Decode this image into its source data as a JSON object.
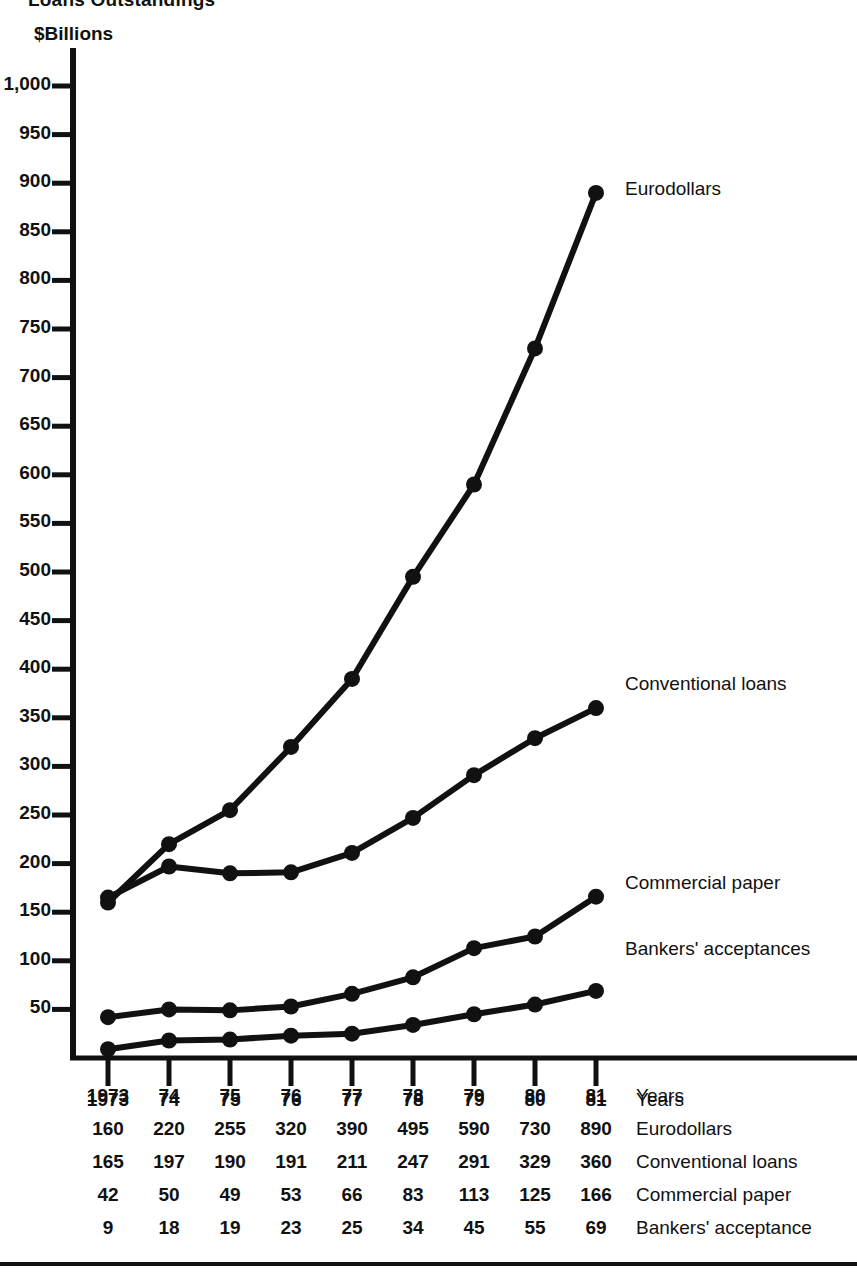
{
  "title": "Loans Outstandings",
  "unit_label": "$Billions",
  "axis": {
    "y_ticks": [
      "1,000",
      "950",
      "900",
      "850",
      "800",
      "750",
      "700",
      "650",
      "600",
      "550",
      "500",
      "450",
      "400",
      "350",
      "300",
      "250",
      "200",
      "150",
      "100",
      "50"
    ],
    "y_tick_values": [
      1000,
      950,
      900,
      850,
      800,
      750,
      700,
      650,
      600,
      550,
      500,
      450,
      400,
      350,
      300,
      250,
      200,
      150,
      100,
      50
    ],
    "x_axis_caption": "Years",
    "x_tick_labels": [
      "1973",
      "74",
      "75",
      "76",
      "77",
      "78",
      "79",
      "80",
      "81"
    ]
  },
  "series_labels": {
    "eurodollars": "Eurodollars",
    "conventional": "Conventional loans",
    "commercial": "Commercial paper",
    "bankers": "Bankers' acceptances"
  },
  "table": {
    "rows": [
      {
        "name": "Years",
        "values": [
          "1973",
          "74",
          "75",
          "76",
          "77",
          "78",
          "79",
          "80",
          "81"
        ]
      },
      {
        "name": "Eurodollars",
        "values": [
          "160",
          "220",
          "255",
          "320",
          "390",
          "495",
          "590",
          "730",
          "890"
        ]
      },
      {
        "name": "Conventional loans",
        "values": [
          "165",
          "197",
          "190",
          "191",
          "211",
          "247",
          "291",
          "329",
          "360"
        ]
      },
      {
        "name": "Commercial paper",
        "values": [
          "42",
          "50",
          "49",
          "53",
          "66",
          "83",
          "113",
          "125",
          "166"
        ]
      },
      {
        "name": "Bankers' acceptance",
        "values": [
          "9",
          "18",
          "19",
          "23",
          "25",
          "34",
          "45",
          "55",
          "69"
        ]
      }
    ]
  },
  "colors": {
    "ink": "#111111",
    "background": "#ffffff"
  },
  "chart_data": {
    "type": "line",
    "title": "Loans Outstandings",
    "xlabel": "Years",
    "ylabel": "$Billions",
    "ylim": [
      0,
      1000
    ],
    "ytick_step": 50,
    "grid": false,
    "legend": "right-inline-callouts",
    "x": [
      "1973",
      "74",
      "75",
      "76",
      "77",
      "78",
      "79",
      "80",
      "81"
    ],
    "series": [
      {
        "name": "Eurodollars",
        "values": [
          160,
          220,
          255,
          320,
          390,
          495,
          590,
          730,
          890
        ]
      },
      {
        "name": "Conventional loans",
        "values": [
          165,
          197,
          190,
          191,
          211,
          247,
          291,
          329,
          360
        ]
      },
      {
        "name": "Commercial paper",
        "values": [
          42,
          50,
          49,
          53,
          66,
          83,
          113,
          125,
          166
        ]
      },
      {
        "name": "Bankers' acceptances",
        "values": [
          9,
          18,
          19,
          23,
          25,
          34,
          45,
          55,
          69
        ]
      }
    ]
  }
}
